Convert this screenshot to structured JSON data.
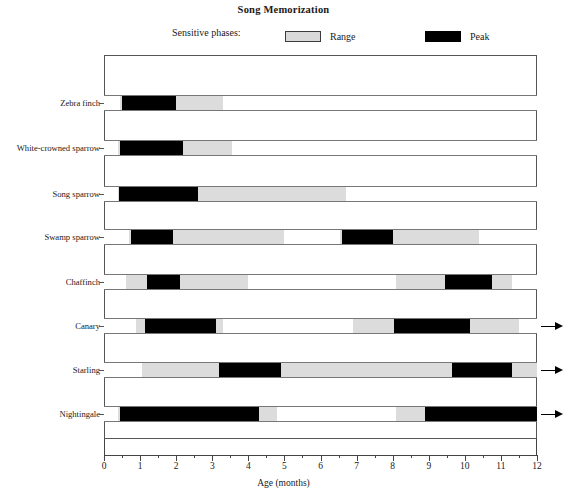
{
  "chart_data": {
    "type": "bar",
    "title": "Song Memorization",
    "subtitle": "",
    "xlabel": "Age (months)",
    "ylabel": "",
    "xlim": [
      0,
      12
    ],
    "xticks": [
      0,
      1,
      2,
      3,
      4,
      5,
      6,
      7,
      8,
      9,
      10,
      11,
      12
    ],
    "xtick_labels": [
      "0",
      "1",
      "2",
      "3",
      "4",
      "5",
      "6",
      "7",
      "8",
      "9",
      "10",
      "11",
      "12"
    ],
    "minor_tick_step": 0.5,
    "grid": false,
    "legend_position": "top",
    "legend_title": "Sensitive phases:",
    "legend": [
      {
        "name": "Range",
        "color": "#dcdcdc"
      },
      {
        "name": "Peak",
        "color": "#000000"
      }
    ],
    "categories": [
      "Zebra finch",
      "White-crowned sparrow",
      "Song sparrow",
      "Swamp sparrow",
      "Chaffinch",
      "Canary",
      "Starling",
      "Nightingale"
    ],
    "series": [
      {
        "name": "Zebra finch",
        "continues_past_axis": false,
        "segments": [
          {
            "type": "range",
            "start": 0.45,
            "end": 3.3
          },
          {
            "type": "peak",
            "start": 0.5,
            "end": 2.0
          }
        ]
      },
      {
        "name": "White-crowned sparrow",
        "continues_past_axis": false,
        "segments": [
          {
            "type": "range",
            "start": 0.4,
            "end": 3.55
          },
          {
            "type": "peak",
            "start": 0.45,
            "end": 2.2
          }
        ]
      },
      {
        "name": "Song sparrow",
        "continues_past_axis": false,
        "segments": [
          {
            "type": "range",
            "start": 0.38,
            "end": 6.7
          },
          {
            "type": "peak",
            "start": 0.42,
            "end": 2.6
          }
        ]
      },
      {
        "name": "Swamp sparrow",
        "continues_past_axis": false,
        "segments": [
          {
            "type": "range",
            "start": 0.7,
            "end": 5.0
          },
          {
            "type": "peak",
            "start": 0.75,
            "end": 1.9
          },
          {
            "type": "range",
            "start": 6.55,
            "end": 10.4
          },
          {
            "type": "peak",
            "start": 6.6,
            "end": 8.0
          }
        ]
      },
      {
        "name": "Chaffinch",
        "continues_past_axis": false,
        "segments": [
          {
            "type": "range",
            "start": 0.6,
            "end": 4.0
          },
          {
            "type": "peak",
            "start": 1.2,
            "end": 2.1
          },
          {
            "type": "range",
            "start": 8.1,
            "end": 11.3
          },
          {
            "type": "peak",
            "start": 9.45,
            "end": 10.75
          }
        ]
      },
      {
        "name": "Canary",
        "continues_past_axis": true,
        "segments": [
          {
            "type": "range",
            "start": 0.9,
            "end": 3.3
          },
          {
            "type": "peak",
            "start": 1.15,
            "end": 3.1
          },
          {
            "type": "range",
            "start": 6.9,
            "end": 11.5
          },
          {
            "type": "peak",
            "start": 8.05,
            "end": 10.15
          }
        ]
      },
      {
        "name": "Starling",
        "continues_past_axis": true,
        "segments": [
          {
            "type": "range",
            "start": 1.05,
            "end": 12.0
          },
          {
            "type": "peak",
            "start": 3.2,
            "end": 4.9
          },
          {
            "type": "peak",
            "start": 9.65,
            "end": 11.3
          }
        ]
      },
      {
        "name": "Nightingale",
        "continues_past_axis": true,
        "segments": [
          {
            "type": "range",
            "start": 0.4,
            "end": 4.8
          },
          {
            "type": "peak",
            "start": 0.45,
            "end": 4.3
          },
          {
            "type": "range",
            "start": 8.1,
            "end": 12.0
          },
          {
            "type": "peak",
            "start": 8.9,
            "end": 12.0
          }
        ]
      }
    ]
  },
  "axis": {
    "xlabel": "Age (months)"
  },
  "title": "Song Memorization",
  "legend": {
    "caption": "Sensitive phases:",
    "range_label": "Range",
    "peak_label": "Peak"
  }
}
